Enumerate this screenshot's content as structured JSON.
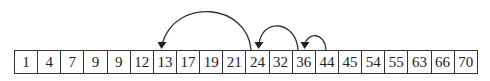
{
  "array": {
    "values": [
      1,
      4,
      7,
      9,
      9,
      12,
      13,
      17,
      19,
      21,
      24,
      32,
      36,
      44,
      45,
      54,
      55,
      63,
      66,
      70
    ]
  },
  "arrows": [
    {
      "from_index": 10,
      "to_index": 6,
      "from_value": 24,
      "to_value": 13
    },
    {
      "from_index": 12,
      "to_index": 10,
      "from_value": 36,
      "to_value": 24
    },
    {
      "from_index": 13,
      "to_index": 12,
      "from_value": 44,
      "to_value": 36
    }
  ],
  "colors": {
    "stroke": "#333333",
    "text": "#222222",
    "background": "#ffffff"
  }
}
